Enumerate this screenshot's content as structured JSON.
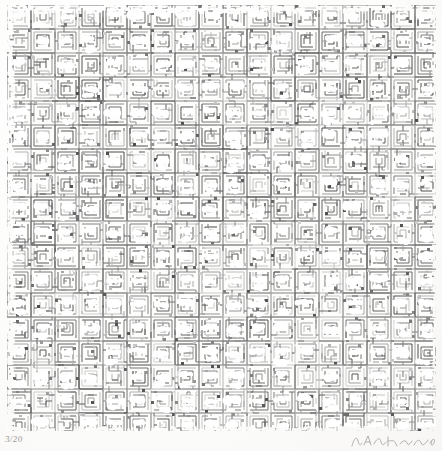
{
  "artwork": {
    "medium_description": "screenprint on paper",
    "ink_color": "#4a4a4a",
    "paper_color": "#fdfdfc",
    "pattern": {
      "type": "repeating-labyrinth-grid",
      "motif_name": "nested-square-maze",
      "tile_pitch_px": 24,
      "sub_cell_px": 3,
      "columns": 18,
      "rows": 18,
      "highlight_shape": "cloud-blob",
      "highlight_color": "#ffffff",
      "line_weight_px": 1,
      "tone_min": "#2e2e2e",
      "tone_max": "#b5b5b5"
    },
    "plate": {
      "left_px": 7,
      "top_px": 5,
      "width_px": 429,
      "height_px": 426
    }
  },
  "annotations": {
    "edition_mark": "3/20",
    "signature": "A. Hirano"
  }
}
